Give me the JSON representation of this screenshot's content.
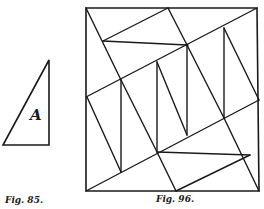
{
  "figures": [
    {
      "id": "fig95",
      "caption": "Fig. 85.",
      "shape_label": "A",
      "triangle": {
        "points": [
          [
            49,
            60
          ],
          [
            3,
            145
          ],
          [
            49,
            145
          ]
        ]
      }
    },
    {
      "id": "fig96",
      "caption": "Fig. 96.",
      "square": {
        "points": [
          [
            86,
            8
          ],
          [
            257,
            8
          ],
          [
            259,
            191
          ],
          [
            86,
            191
          ]
        ]
      },
      "lines": [
        [
          [
            86,
            8
          ],
          [
            121,
            80
          ]
        ],
        [
          [
            168,
            8
          ],
          [
            187,
            45
          ]
        ],
        [
          [
            103,
            41
          ],
          [
            168,
            8
          ]
        ],
        [
          [
            103,
            41
          ],
          [
            187,
            45
          ]
        ],
        [
          [
            257,
            8
          ],
          [
            86,
            97
          ]
        ],
        [
          [
            86,
            191
          ],
          [
            259,
            100
          ]
        ],
        [
          [
            121,
            80
          ],
          [
            121,
            172
          ]
        ],
        [
          [
            157,
            62
          ],
          [
            157,
            152
          ]
        ],
        [
          [
            187,
            45
          ],
          [
            187,
            135
          ]
        ],
        [
          [
            224,
            28
          ],
          [
            224,
            118
          ]
        ],
        [
          [
            87,
            97
          ],
          [
            121,
            172
          ]
        ],
        [
          [
            121,
            80
          ],
          [
            157,
            152
          ]
        ],
        [
          [
            157,
            62
          ],
          [
            187,
            135
          ]
        ],
        [
          [
            187,
            45
          ],
          [
            224,
            118
          ]
        ],
        [
          [
            224,
            28
          ],
          [
            259,
            100
          ]
        ],
        [
          [
            157,
            152
          ],
          [
            176,
            191
          ]
        ],
        [
          [
            157,
            152
          ],
          [
            250,
            155
          ]
        ],
        [
          [
            176,
            191
          ],
          [
            250,
            155
          ]
        ],
        [
          [
            224,
            118
          ],
          [
            259,
            191
          ]
        ]
      ]
    }
  ],
  "colors": {
    "stroke": "#1a1a1a",
    "background": "#ffffff"
  }
}
